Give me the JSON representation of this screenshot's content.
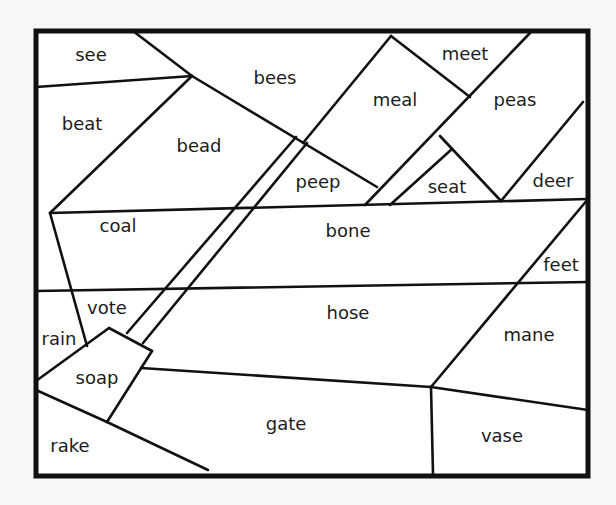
{
  "puzzle": {
    "frame": {
      "x1": 36,
      "y1": 31,
      "x2": 588,
      "y2": 476
    },
    "line_color": "#111111",
    "background": "#ffffff",
    "regions": [
      {
        "word": "see",
        "x": 91,
        "y": 55
      },
      {
        "word": "bees",
        "x": 275,
        "y": 78
      },
      {
        "word": "meet",
        "x": 465,
        "y": 54
      },
      {
        "word": "meal",
        "x": 395,
        "y": 100
      },
      {
        "word": "peas",
        "x": 515,
        "y": 100
      },
      {
        "word": "beat",
        "x": 82,
        "y": 124
      },
      {
        "word": "bead",
        "x": 199,
        "y": 146
      },
      {
        "word": "peep",
        "x": 318,
        "y": 182
      },
      {
        "word": "seat",
        "x": 447,
        "y": 187
      },
      {
        "word": "deer",
        "x": 553,
        "y": 181
      },
      {
        "word": "coal",
        "x": 118,
        "y": 226
      },
      {
        "word": "bone",
        "x": 348,
        "y": 231
      },
      {
        "word": "feet",
        "x": 561,
        "y": 265
      },
      {
        "word": "vote",
        "x": 107,
        "y": 308
      },
      {
        "word": "hose",
        "x": 348,
        "y": 313
      },
      {
        "word": "rain",
        "x": 59,
        "y": 339
      },
      {
        "word": "mane",
        "x": 529,
        "y": 335
      },
      {
        "word": "soap",
        "x": 97,
        "y": 378
      },
      {
        "word": "gate",
        "x": 286,
        "y": 424
      },
      {
        "word": "vase",
        "x": 502,
        "y": 436
      },
      {
        "word": "rake",
        "x": 70,
        "y": 446
      }
    ],
    "segments": [
      [
        36,
        87,
        192,
        76
      ],
      [
        133,
        31,
        192,
        76
      ],
      [
        192,
        76,
        377,
        187
      ],
      [
        192,
        76,
        50,
        213
      ],
      [
        50,
        213,
        588,
        199
      ],
      [
        391,
        36,
        303,
        143
      ],
      [
        391,
        36,
        470,
        97
      ],
      [
        530,
        33,
        365,
        205
      ],
      [
        440,
        136,
        501,
        201
      ],
      [
        452,
        149,
        390,
        205
      ],
      [
        583,
        102,
        501,
        201
      ],
      [
        296,
        137,
        127,
        333
      ],
      [
        307,
        143,
        143,
        343
      ],
      [
        50,
        213,
        87,
        346
      ],
      [
        36,
        291,
        588,
        282
      ],
      [
        588,
        199,
        431,
        387
      ],
      [
        36,
        381,
        109,
        328
      ],
      [
        109,
        328,
        152,
        351
      ],
      [
        152,
        351,
        107,
        422
      ],
      [
        36,
        390,
        107,
        422
      ],
      [
        107,
        422,
        208,
        470
      ],
      [
        141,
        368,
        431,
        387
      ],
      [
        431,
        387,
        588,
        410
      ],
      [
        431,
        387,
        433,
        474
      ]
    ]
  }
}
